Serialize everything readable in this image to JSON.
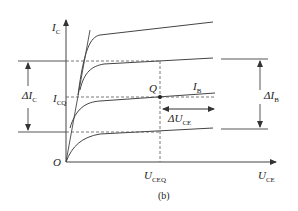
{
  "figure": {
    "caption": "(b)",
    "axes": {
      "y_label_main": "I",
      "y_label_sub": "C",
      "x_label_main": "U",
      "x_label_sub": "CE",
      "origin_label": "O"
    },
    "labels": {
      "delta_ic_prefix": "ΔI",
      "delta_ic_sub": "C",
      "icq_main": "I",
      "icq_sub": "CQ",
      "q_point": "Q",
      "ib_main": "I",
      "ib_sub": "B",
      "delta_uce_prefix": "ΔU",
      "delta_uce_sub": "CE",
      "uceq_main": "U",
      "uceq_sub": "CEQ",
      "delta_ib_prefix": "ΔI",
      "delta_ib_sub": "B"
    },
    "curves_count": 4,
    "line_color": "#333333"
  }
}
